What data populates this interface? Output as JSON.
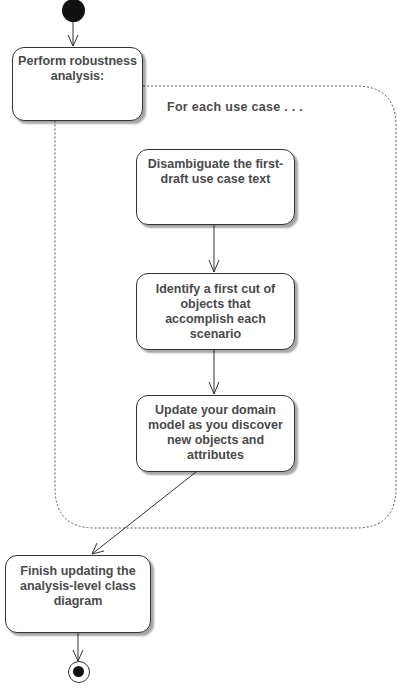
{
  "diagram": {
    "type": "uml-activity",
    "region_label": "For each use case . . .",
    "nodes": [
      {
        "id": "perform",
        "label": "Perform robustness analysis:"
      },
      {
        "id": "disambiguate",
        "label": "Disambiguate the first-draft use case text"
      },
      {
        "id": "identify",
        "label": "Identify a first cut of objects that accomplish each scenario"
      },
      {
        "id": "update",
        "label": "Update your domain model as you discover new objects and attributes"
      },
      {
        "id": "finish",
        "label": "Finish updating the analysis-level class diagram"
      }
    ],
    "edges": [
      {
        "from": "start",
        "to": "perform"
      },
      {
        "from": "disambiguate",
        "to": "identify"
      },
      {
        "from": "identify",
        "to": "update"
      },
      {
        "from": "update",
        "to": "finish"
      },
      {
        "from": "finish",
        "to": "end"
      }
    ],
    "colors": {
      "stroke": "#333333",
      "text": "#4a4a4a",
      "fill": "#ffffff",
      "initial": "#111111"
    }
  }
}
